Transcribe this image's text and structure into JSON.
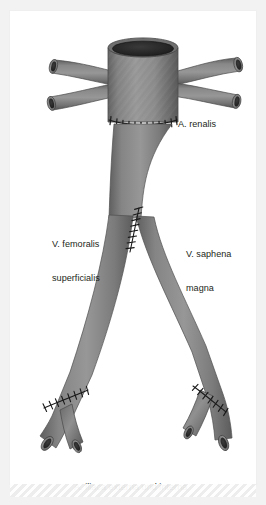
{
  "figure": {
    "background_color": "#f2f2f2",
    "plate_color": "#ffffff",
    "vessel_color": "#8a8a8a",
    "vessel_shadow_color": "#5c5c5c",
    "vessel_highlight_color": "#a9a9a9",
    "lumen_color": "#2b2b2b",
    "suture_color": "#1c1c1c",
    "label_color": "#231f20"
  },
  "labels": {
    "a_renalis": "A. renalis",
    "v_femoralis_line1": "V. femoralis",
    "v_femoralis_line2": "superficialis",
    "v_saphena_line1": "V. saphena",
    "v_saphena_line2": "magna",
    "a_iliaca": "A. iliaca externa und interna"
  },
  "structures": [
    {
      "name": "aortic-trunk-graft",
      "description": "upper tubular graft with open lumen at top"
    },
    {
      "name": "renal-artery-left-upper",
      "description": "left upper cut branch"
    },
    {
      "name": "renal-artery-left-lower",
      "description": "left lower cut branch"
    },
    {
      "name": "renal-artery-right-upper",
      "description": "right upper cut branch"
    },
    {
      "name": "renal-artery-right-lower",
      "description": "right lower cut branch"
    },
    {
      "name": "proximal-anastomosis-suture",
      "description": "horizontal suture row below graft"
    },
    {
      "name": "vein-conduit-trunk",
      "description": "long descending venous conduit"
    },
    {
      "name": "mid-bifurcation-suture",
      "description": "vertical suture at leg division"
    },
    {
      "name": "left-iliac-limb",
      "description": "left descending limb"
    },
    {
      "name": "right-iliac-limb",
      "description": "right descending limb"
    },
    {
      "name": "left-distal-anastomosis-suture",
      "description": "diagonal suture at left distal fork"
    },
    {
      "name": "right-distal-anastomosis-suture",
      "description": "diagonal suture at right distal fork"
    },
    {
      "name": "left-iliac-externa-stump",
      "description": "left outer cut end"
    },
    {
      "name": "left-iliac-interna-stump",
      "description": "left inner cut end"
    },
    {
      "name": "right-iliac-interna-stump",
      "description": "right inner cut end"
    },
    {
      "name": "right-iliac-externa-stump",
      "description": "right outer cut end"
    }
  ]
}
